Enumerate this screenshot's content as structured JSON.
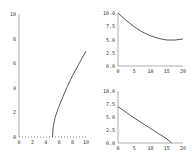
{
  "chart_data": [
    {
      "type": "line",
      "title": "",
      "xlabel": "",
      "ylabel": "",
      "xlim": [
        0,
        10
      ],
      "ylim": [
        0,
        10
      ],
      "xticks": [
        "0",
        "2",
        "4",
        "6",
        "8",
        "10"
      ],
      "yticks": [
        "0",
        "2",
        "4",
        "6",
        "8",
        "10"
      ],
      "grid": false,
      "series": [
        {
          "name": "trajectory",
          "x": [
            5,
            5.1,
            5.4,
            5.9,
            6.5,
            7.2,
            8.0,
            9.0,
            10.0
          ],
          "y": [
            0,
            0.8,
            1.6,
            2.4,
            3.2,
            4.1,
            5.0,
            6.0,
            7.0
          ]
        }
      ]
    },
    {
      "type": "line",
      "title": "",
      "xlabel": "",
      "ylabel": "",
      "xlim": [
        0,
        20
      ],
      "ylim": [
        0,
        10
      ],
      "xticks": [
        "0",
        "5",
        "10",
        "15",
        "20"
      ],
      "yticks": [
        "0.0",
        "2.5",
        "5.0",
        "7.5",
        "10.0"
      ],
      "grid": false,
      "series": [
        {
          "name": "decay-top",
          "x": [
            0,
            2.5,
            5,
            7.5,
            10,
            12.5,
            15,
            17.5,
            20
          ],
          "y": [
            10,
            8.6,
            7.4,
            6.4,
            5.7,
            5.2,
            4.9,
            4.9,
            5.1
          ]
        }
      ]
    },
    {
      "type": "line",
      "title": "",
      "xlabel": "",
      "ylabel": "",
      "xlim": [
        0,
        20
      ],
      "ylim": [
        0,
        10
      ],
      "xticks": [
        "0",
        "5",
        "10",
        "15",
        "20"
      ],
      "yticks": [
        "0.0",
        "2.5",
        "5.0",
        "7.5",
        "10.0"
      ],
      "grid": false,
      "series": [
        {
          "name": "decay-bottom",
          "x": [
            0,
            2.5,
            5,
            7.5,
            10,
            12.5,
            15,
            16.5
          ],
          "y": [
            7,
            5.9,
            4.8,
            3.8,
            2.8,
            1.8,
            0.8,
            0
          ]
        }
      ]
    }
  ]
}
